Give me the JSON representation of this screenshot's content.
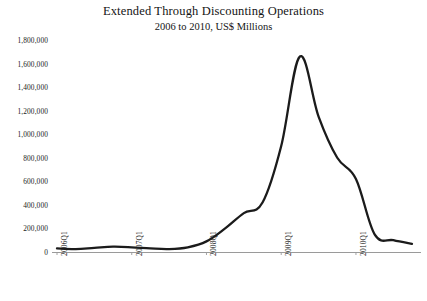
{
  "chart_data": {
    "type": "line",
    "title": "Extended Through Discounting Operations",
    "subtitle": "2006 to 2010, US$ Millions",
    "xlabel": "",
    "ylabel": "",
    "grid": false,
    "legend": "none",
    "ylim": [
      0,
      1800000
    ],
    "ytick_labels": [
      "1,800,000",
      "1,600,000",
      "1,400,000",
      "1,200,000",
      "1,000,000",
      "800,000",
      "600,000",
      "400,000",
      "200,000",
      "0"
    ],
    "ytick_values": [
      1800000,
      1600000,
      1400000,
      1200000,
      1000000,
      800000,
      600000,
      400000,
      200000,
      0
    ],
    "xtick_labels": [
      "2006Q1",
      "2007Q1",
      "2008Q1",
      "2009Q1",
      "2010Q1"
    ],
    "categories": [
      "2006Q1",
      "2006Q2",
      "2006Q3",
      "2006Q4",
      "2007Q1",
      "2007Q2",
      "2007Q3",
      "2007Q4",
      "2008Q1",
      "2008Q2",
      "2008Q3",
      "2008Q4",
      "2009Q1",
      "2009Q2",
      "2009Q3",
      "2009Q4",
      "2010Q1",
      "2010Q2",
      "2010Q3",
      "2010Q4"
    ],
    "series": [
      {
        "name": "Extended Through Discounting Operations",
        "values": [
          30000,
          25000,
          35000,
          45000,
          40000,
          30000,
          25000,
          40000,
          90000,
          200000,
          330000,
          420000,
          900000,
          1660000,
          1150000,
          800000,
          620000,
          150000,
          100000,
          70000
        ]
      }
    ],
    "colors": {
      "series_line": "#1b1b1b",
      "axis": "#9a9a9a",
      "text": "#1a1a1a",
      "background": "#ffffff"
    }
  }
}
